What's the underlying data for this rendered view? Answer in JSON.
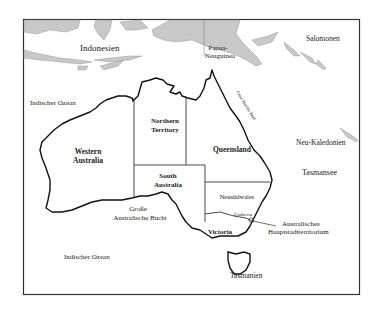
{
  "map": {
    "colors": {
      "background": "#ffffff",
      "land_foreign": "#c8c8c8",
      "land_australia": "#ffffff",
      "coast": "#111111",
      "frame": "#333333",
      "text": "#222222"
    },
    "labels": {
      "indonesia": "Indonesien",
      "png_line1": "Papua-",
      "png_line2": "Neuguinea",
      "salomonen": "Salomonen",
      "indian_ocean_north": "Indischer Ozean",
      "indian_ocean_south": "Indischer Ozean",
      "great_barrier_reef": "Great Barrier Reef",
      "neu_kaledonien": "Neu-Kaledonien",
      "tasmansee": "Tasmansee",
      "grosse_bucht_line1": "Große",
      "grosse_bucht_line2": "Australische Bucht",
      "canberra": "Canberra",
      "act_line1": "Australisches",
      "act_line2": "Hauptstadtterritorium",
      "tasmanien": "Tasmanien"
    },
    "states": {
      "western_australia_line1": "Western",
      "western_australia_line2": "Australia",
      "northern_territory_line1": "Northern",
      "northern_territory_line2": "Territory",
      "south_australia_line1": "South",
      "south_australia_line2": "Australia",
      "queensland": "Queensland",
      "neusuedwales": "Neusüdwales",
      "victoria": "Victoria"
    }
  }
}
